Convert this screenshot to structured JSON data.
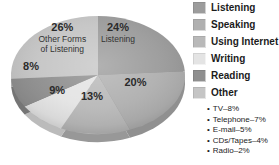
{
  "chart_data": {
    "type": "pie",
    "title": "",
    "unit": "%",
    "legend_position": "right",
    "style": "3d-grayscale",
    "slices": [
      {
        "label": "Listening",
        "value": 24,
        "color": "#9c9c9c",
        "pie_sublabel": [
          "Listening"
        ]
      },
      {
        "label": "Speaking",
        "value": 20,
        "color": "#b0b0b0",
        "pie_sublabel": []
      },
      {
        "label": "Using Internet",
        "value": 13,
        "color": "#b9b9b9",
        "pie_sublabel": []
      },
      {
        "label": "Writing",
        "value": 9,
        "color": "#e4e4e4",
        "pie_sublabel": []
      },
      {
        "label": "Reading",
        "value": 8,
        "color": "#8f8f8f",
        "pie_sublabel": []
      },
      {
        "label": "Other",
        "value": 26,
        "color": "#c5c5c5",
        "pie_sublabel": [
          "Other Forms",
          "of Listening"
        ]
      }
    ],
    "other_breakdown": [
      "TV–8%",
      "Telephone–7%",
      "E-mail–5%",
      "CDs/Tapes–4%",
      "Radio–2%"
    ]
  }
}
